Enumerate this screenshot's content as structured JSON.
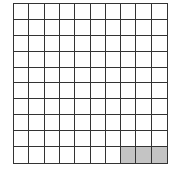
{
  "grid": {
    "rows": 10,
    "cols": 10,
    "total_cells": 100,
    "shaded_count": 3,
    "shaded_cells": [
      {
        "row": 10,
        "col": 8
      },
      {
        "row": 10,
        "col": 9
      },
      {
        "row": 10,
        "col": 10
      }
    ],
    "colors": {
      "line": "#333333",
      "empty": "#ffffff",
      "shaded": "#c4c4c4"
    }
  }
}
